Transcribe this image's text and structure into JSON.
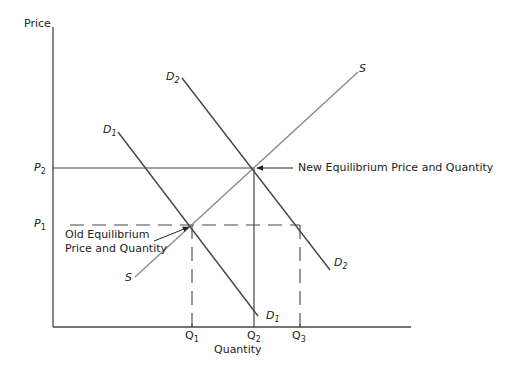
{
  "diagram": {
    "type": "supply-demand",
    "axes": {
      "y_label": "Price",
      "x_label": "Quantity"
    },
    "price_levels": [
      {
        "id": "P1",
        "letter": "P",
        "sub": "1"
      },
      {
        "id": "P2",
        "letter": "P",
        "sub": "2"
      }
    ],
    "quantity_levels": [
      {
        "id": "Q1",
        "letter": "Q",
        "sub": "1"
      },
      {
        "id": "Q2",
        "letter": "Q",
        "sub": "2"
      },
      {
        "id": "Q3",
        "letter": "Q",
        "sub": "3"
      }
    ],
    "curves": {
      "supply": {
        "label_top": "S",
        "label_bottom": "S"
      },
      "demand1": {
        "letter": "D",
        "sub": "1"
      },
      "demand2": {
        "letter": "D",
        "sub": "2"
      }
    },
    "annotations": {
      "new_equilibrium": "New Equilibrium Price and Quantity",
      "old_equilibrium_line1": "Old Equilibrium",
      "old_equilibrium_line2": "Price and Quantity"
    },
    "colors": {
      "axis": "#444444",
      "demand": "#444444",
      "supply": "#8a8a8a",
      "text": "#222222"
    }
  }
}
